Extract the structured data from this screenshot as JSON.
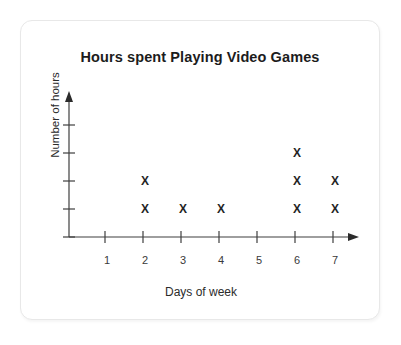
{
  "card": {
    "background": "#ffffff",
    "border_color": "#e8e8e8"
  },
  "chart_data": {
    "type": "scatter",
    "title": "Hours spent Playing Video Games",
    "xlabel": "Days of week",
    "ylabel": "Number of hours",
    "marker": "X",
    "marker_color": "#242424",
    "axis_color": "#3f3f3f",
    "grid": false,
    "legend": null,
    "categories": [
      "1",
      "2",
      "3",
      "4",
      "5",
      "6",
      "7"
    ],
    "xtick_labels": [
      "1",
      "2",
      "3",
      "4",
      "5",
      "6",
      "7"
    ],
    "ytick_labels": [],
    "ytick_count": 5,
    "xlim": [
      0,
      7.6
    ],
    "ylim": [
      0,
      5.4
    ],
    "values": [
      0,
      2,
      1,
      1,
      0,
      3,
      2
    ],
    "points": [
      {
        "x": 2,
        "y": 1
      },
      {
        "x": 2,
        "y": 2
      },
      {
        "x": 3,
        "y": 1
      },
      {
        "x": 4,
        "y": 1
      },
      {
        "x": 6,
        "y": 1
      },
      {
        "x": 6,
        "y": 2
      },
      {
        "x": 6,
        "y": 3
      },
      {
        "x": 7,
        "y": 1
      },
      {
        "x": 7,
        "y": 2
      }
    ]
  }
}
